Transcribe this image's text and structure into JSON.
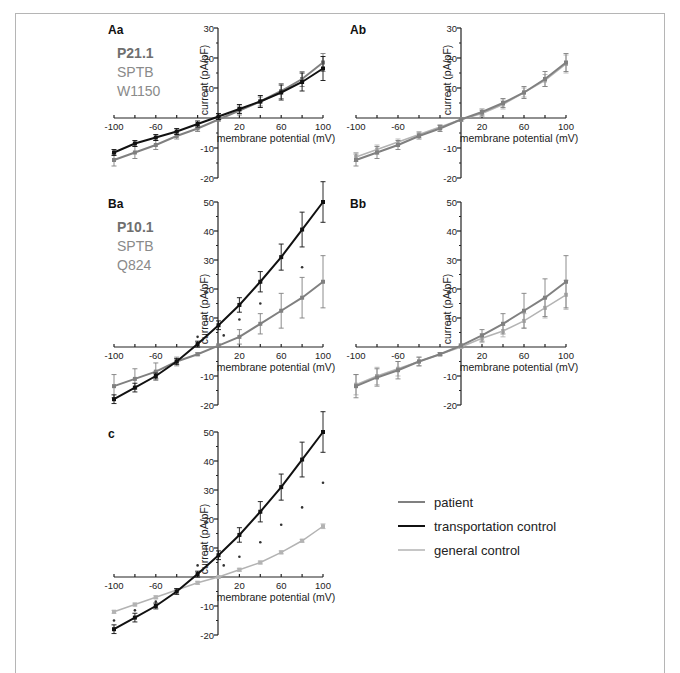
{
  "figure": {
    "legend": [
      {
        "key": "patient",
        "label": "patient",
        "color": "#808080",
        "width": 2
      },
      {
        "key": "transport",
        "label": "transportation control",
        "color": "#111111",
        "width": 2
      },
      {
        "key": "general",
        "label": "general control",
        "color": "#b3b3b3",
        "width": 1.5
      }
    ],
    "axis_labels": {
      "x": "membrane potential (mV)",
      "y": "current (pA/pF)"
    }
  },
  "chart_data": [
    {
      "panel": "Aa",
      "type": "line",
      "annotation": [
        "P21.1",
        "SPTB",
        "W1150"
      ],
      "xlabel": "membrane potential (mV)",
      "ylabel": "current (pA/pF)",
      "xlim": [
        -100,
        100
      ],
      "ylim": [
        -20,
        30
      ],
      "xticks": [
        -100,
        -60,
        20,
        60,
        100
      ],
      "yticks": [
        -20,
        -10,
        10,
        20,
        30
      ],
      "x": [
        -100,
        -80,
        -60,
        -40,
        -20,
        0,
        20,
        40,
        60,
        80,
        100
      ],
      "series": [
        {
          "name": "transportation control",
          "values": [
            -11.5,
            -8.5,
            -6.5,
            -4.5,
            -2,
            0.5,
            3,
            5.5,
            8.5,
            12,
            16.5
          ],
          "err": [
            1,
            1,
            1,
            1,
            1,
            1,
            1.5,
            2,
            2.5,
            3,
            4
          ]
        },
        {
          "name": "patient",
          "values": [
            -14,
            -11.5,
            -9,
            -6,
            -3.5,
            -0.5,
            2.5,
            5.5,
            9,
            13,
            18.5
          ],
          "err": [
            2,
            2,
            1.5,
            1,
            1,
            0.5,
            1.5,
            1.5,
            2.5,
            2.5,
            3
          ]
        }
      ]
    },
    {
      "panel": "Ab",
      "type": "line",
      "xlabel": "membrane potential (mV)",
      "ylabel": "current (pA/pF)",
      "xlim": [
        -100,
        100
      ],
      "ylim": [
        -20,
        30
      ],
      "xticks": [
        -100,
        -60,
        20,
        60,
        100
      ],
      "yticks": [
        -20,
        -10,
        10,
        20,
        30
      ],
      "x": [
        -100,
        -80,
        -60,
        -40,
        -20,
        0,
        20,
        40,
        60,
        80,
        100
      ],
      "series": [
        {
          "name": "patient",
          "values": [
            -14,
            -11.5,
            -9,
            -6,
            -3.5,
            -0.5,
            2,
            5,
            8.5,
            13,
            18.5
          ],
          "err": [
            2,
            2,
            1.5,
            1,
            1,
            0.5,
            1,
            1.5,
            2,
            2.5,
            3
          ]
        },
        {
          "name": "general control",
          "values": [
            -13,
            -10.5,
            -8,
            -5.5,
            -3,
            -0.5,
            1.5,
            4.5,
            8.5,
            12.5,
            18
          ],
          "err": [
            1.5,
            1.5,
            1,
            1,
            0.8,
            0.5,
            1,
            1.5,
            1.5,
            2,
            3
          ]
        }
      ]
    },
    {
      "panel": "Ba",
      "type": "line",
      "annotation": [
        "P10.1",
        "SPTB",
        "Q824"
      ],
      "xlabel": "membrane potential (mV)",
      "ylabel": "current (pA/pF)",
      "xlim": [
        -100,
        100
      ],
      "ylim": [
        -20,
        50
      ],
      "xticks": [
        -100,
        -60,
        20,
        60,
        100
      ],
      "yticks": [
        -20,
        -10,
        10,
        20,
        30,
        40,
        50
      ],
      "x": [
        -100,
        -80,
        -60,
        -40,
        -20,
        0,
        20,
        40,
        60,
        80,
        100
      ],
      "series": [
        {
          "name": "transportation control",
          "values": [
            -18,
            -14,
            -10,
            -5,
            1,
            7.5,
            14.5,
            22.5,
            31,
            40.5,
            50
          ],
          "err": [
            1.5,
            1.5,
            1,
            1,
            1,
            1.5,
            2.5,
            3.5,
            4.5,
            6,
            7
          ]
        },
        {
          "name": "patient",
          "values": [
            -13.5,
            -11,
            -8.5,
            -5,
            -2.5,
            0.5,
            3.5,
            8,
            12.5,
            17,
            22.5
          ],
          "err": [
            4,
            3.5,
            3,
            1.5,
            0.5,
            0.5,
            2.5,
            3.5,
            6,
            7,
            9
          ]
        }
      ],
      "significance_markers": [
        {
          "x": -20,
          "y": 3.5
        },
        {
          "x": 5,
          "y": 4
        },
        {
          "x": 20,
          "y": 9.5
        },
        {
          "x": 40,
          "y": 15
        },
        {
          "x": 80,
          "y": 27.5
        }
      ]
    },
    {
      "panel": "Bb",
      "type": "line",
      "xlabel": "membrane potential (mV)",
      "ylabel": "current (pA/pF)",
      "xlim": [
        -100,
        100
      ],
      "ylim": [
        -20,
        50
      ],
      "xticks": [
        -100,
        -60,
        20,
        60,
        100
      ],
      "yticks": [
        -20,
        -10,
        10,
        20,
        30,
        40,
        50
      ],
      "x": [
        -100,
        -80,
        -60,
        -40,
        -20,
        0,
        20,
        40,
        60,
        80,
        100
      ],
      "series": [
        {
          "name": "patient",
          "values": [
            -13.5,
            -10.5,
            -8,
            -5,
            -2.5,
            0.5,
            4,
            8,
            12.5,
            17,
            22.5
          ],
          "err": [
            4,
            3,
            3,
            1.5,
            0.5,
            0.5,
            2,
            3.5,
            6,
            6.5,
            9
          ]
        },
        {
          "name": "general control",
          "values": [
            -13,
            -10,
            -7.5,
            -5,
            -2.5,
            0,
            3,
            5.5,
            9,
            13.5,
            18
          ],
          "err": [
            3.5,
            3,
            2.5,
            1.5,
            0.5,
            0.5,
            1.5,
            2,
            2.5,
            3.5,
            5
          ]
        }
      ]
    },
    {
      "panel": "c",
      "type": "line",
      "xlabel": "membrane potential (mV)",
      "ylabel": "current (pA/pF)",
      "xlim": [
        -100,
        100
      ],
      "ylim": [
        -20,
        50
      ],
      "xticks": [
        -100,
        -60,
        20,
        60,
        100
      ],
      "yticks": [
        -20,
        -10,
        10,
        20,
        30,
        40,
        50
      ],
      "x": [
        -100,
        -80,
        -60,
        -40,
        -20,
        0,
        20,
        40,
        60,
        80,
        100
      ],
      "series": [
        {
          "name": "transportation control",
          "values": [
            -18,
            -14,
            -10,
            -5,
            1,
            7.5,
            14.5,
            22.5,
            31,
            40.5,
            50
          ],
          "err": [
            1.5,
            1.5,
            1,
            1,
            1,
            1.5,
            2.5,
            3.5,
            4.5,
            6,
            7
          ]
        },
        {
          "name": "general control",
          "values": [
            -12,
            -9.5,
            -7,
            -4.5,
            -2,
            0,
            2.5,
            5,
            8.5,
            12.5,
            17.5
          ],
          "err": [
            0.5,
            0.5,
            0.5,
            0.5,
            0.5,
            0.3,
            0.5,
            0.5,
            0.5,
            0.5,
            0.8
          ]
        }
      ],
      "significance_markers": [
        {
          "x": -100,
          "y": -15
        },
        {
          "x": -80,
          "y": -11.5
        },
        {
          "x": -60,
          "y": -8.5
        },
        {
          "x": -20,
          "y": 4
        },
        {
          "x": 5,
          "y": 4
        },
        {
          "x": 20,
          "y": 7
        },
        {
          "x": 40,
          "y": 12
        },
        {
          "x": 60,
          "y": 18
        },
        {
          "x": 80,
          "y": 24
        },
        {
          "x": 100,
          "y": 32.5
        }
      ]
    }
  ]
}
